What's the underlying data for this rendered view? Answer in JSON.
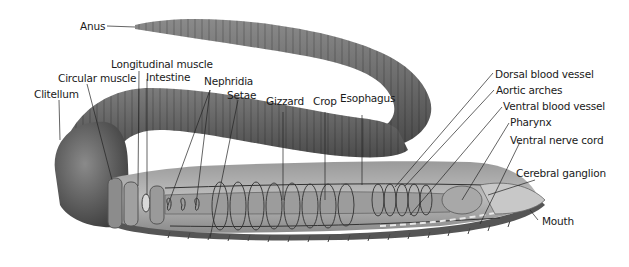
{
  "diagram": {
    "colors": {
      "body": "#6e6e6e",
      "body_dark": "#3a3a3a",
      "body_light": "#a8a8a8",
      "leader": "#222222",
      "text": "#1a1a1a",
      "background": "#ffffff"
    },
    "labels": {
      "anus": "Anus",
      "longitudinal_muscle": "Longitudinal muscle",
      "circular_muscle": "Circular muscle",
      "intestine": "Intestine",
      "clitellum": "Clitellum",
      "nephridia": "Nephridia",
      "setae": "Setae",
      "gizzard": "Gizzard",
      "crop": "Crop",
      "esophagus": "Esophagus",
      "dorsal_blood_vessel": "Dorsal blood vessel",
      "aortic_arches": "Aortic arches",
      "ventral_blood_vessel": "Ventral blood vessel",
      "pharynx": "Pharynx",
      "ventral_nerve_cord": "Ventral nerve cord",
      "cerebral_ganglion": "Cerebral ganglion",
      "mouth": "Mouth"
    }
  }
}
